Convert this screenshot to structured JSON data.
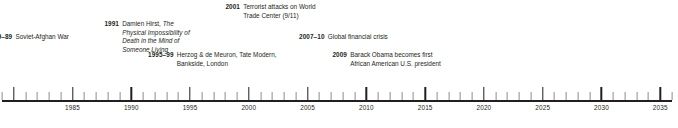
{
  "figure": {
    "kind": "historical-timeline",
    "text_color": "#231f20",
    "axis_color": "#231f20",
    "minor_tick_color": "#8c8c8c",
    "background": "#ffffff"
  },
  "axis": {
    "start_year": 1979,
    "end_year": 2036,
    "minor_tick_interval": 1,
    "major_tick_interval": 5,
    "labels": [
      {
        "year": 1985,
        "text": "1985"
      },
      {
        "year": 1990,
        "text": "1990"
      },
      {
        "year": 1995,
        "text": "1995"
      },
      {
        "year": 2000,
        "text": "2000"
      },
      {
        "year": 2005,
        "text": "2005"
      },
      {
        "year": 2010,
        "text": "2010"
      },
      {
        "year": 2015,
        "text": "2015"
      },
      {
        "year": 2020,
        "text": "2020"
      },
      {
        "year": 2025,
        "text": "2025"
      },
      {
        "year": 2030,
        "text": "2030"
      },
      {
        "year": 2035,
        "text": "2035"
      }
    ]
  },
  "entries": [
    {
      "id": "afghan",
      "year": "79–89",
      "line1": "Soviet-Afghan War",
      "line2": "",
      "line3": "",
      "italic_lines": []
    },
    {
      "id": "hirst",
      "year": "1991",
      "line1_plain": "Damien Hirst, ",
      "line1_italic": "The Physical",
      "line2": "Impossibility of Death in the",
      "line3": "Mind of Someone Living"
    },
    {
      "id": "herzog",
      "year": "1995–99",
      "line1": "Herzog & de Meuron,",
      "line2": "Tate Modern, Bankside, London",
      "line3": ""
    },
    {
      "id": "wtc",
      "year": "2001",
      "line1": "Terrorist attacks on World",
      "line2": "Trade Center (9/11)",
      "line3": ""
    },
    {
      "id": "crisis",
      "year": "2007–10",
      "line1": "Global financial crisis",
      "line2": "",
      "line3": ""
    },
    {
      "id": "obama",
      "year": "2009",
      "line1": "Barack Obama becomes first",
      "line2": "African American U.S. president",
      "line3": ""
    }
  ]
}
